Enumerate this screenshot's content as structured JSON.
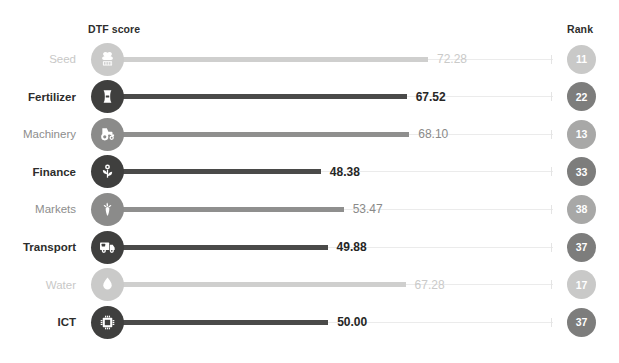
{
  "header": {
    "score_column_label": "DTF score",
    "rank_column_label": "Rank"
  },
  "colors": {
    "dark_bar": "#4a4a49",
    "mid_bar": "#8f8f8e",
    "light_bar": "#cfcfce",
    "dark_text": "#2d2d2c",
    "mid_text": "#8d8d8c",
    "light_text": "#c8c8c7",
    "background": "#ffffff"
  },
  "chart_data": {
    "type": "bar",
    "title": "",
    "subtitle": "",
    "xlabel": "DTF score",
    "ylabel": "",
    "xlim": [
      0,
      100
    ],
    "grid": false,
    "legend": "none",
    "orientation": "horizontal",
    "categories": [
      "Seed",
      "Fertilizer",
      "Machinery",
      "Finance",
      "Markets",
      "Transport",
      "Water",
      "ICT"
    ],
    "values": [
      72.28,
      67.52,
      68.1,
      48.38,
      53.47,
      49.88,
      67.28,
      50.0
    ],
    "value_labels": [
      "72.28",
      "67.52",
      "68.10",
      "48.38",
      "53.47",
      "49.88",
      "67.28",
      "50.00"
    ],
    "ranks": [
      11,
      22,
      13,
      33,
      38,
      37,
      17,
      37
    ],
    "rank_labels": [
      "11",
      "22",
      "13",
      "33",
      "38",
      "37",
      "17",
      "37"
    ],
    "annotations": [
      "DTF score",
      "Rank"
    ]
  },
  "rows": [
    {
      "label": "Seed",
      "value": 72.28,
      "value_label": "72.28",
      "rank": "11",
      "icon": "seed-bag-icon",
      "tier": "light"
    },
    {
      "label": "Fertilizer",
      "value": 67.52,
      "value_label": "67.52",
      "rank": "22",
      "icon": "fertilizer-sack-icon",
      "tier": "dark"
    },
    {
      "label": "Machinery",
      "value": 68.1,
      "value_label": "68.10",
      "rank": "13",
      "icon": "tractor-icon",
      "tier": "mid"
    },
    {
      "label": "Finance",
      "value": 48.38,
      "value_label": "48.38",
      "rank": "33",
      "icon": "sprout-coin-icon",
      "tier": "dark"
    },
    {
      "label": "Markets",
      "value": 53.47,
      "value_label": "53.47",
      "rank": "38",
      "icon": "carrot-icon",
      "tier": "mid"
    },
    {
      "label": "Transport",
      "value": 49.88,
      "value_label": "49.88",
      "rank": "37",
      "icon": "delivery-truck-icon",
      "tier": "dark"
    },
    {
      "label": "Water",
      "value": 67.28,
      "value_label": "67.28",
      "rank": "17",
      "icon": "water-drop-icon",
      "tier": "light"
    },
    {
      "label": "ICT",
      "value": 50.0,
      "value_label": "50.00",
      "rank": "37",
      "icon": "microchip-icon",
      "tier": "dark"
    }
  ]
}
